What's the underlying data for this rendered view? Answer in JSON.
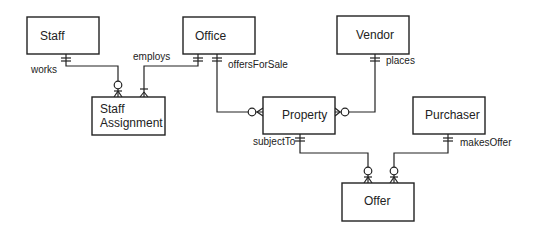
{
  "diagram": {
    "type": "entity-relationship",
    "notation": "crow's foot",
    "entities": [
      {
        "id": "staff",
        "label": [
          "Staff"
        ],
        "x": 27,
        "y": 17,
        "w": 72,
        "h": 37
      },
      {
        "id": "office",
        "label": [
          "Office"
        ],
        "x": 183,
        "y": 17,
        "w": 72,
        "h": 37
      },
      {
        "id": "vendor",
        "label": [
          "Vendor"
        ],
        "x": 337,
        "y": 16,
        "w": 72,
        "h": 38
      },
      {
        "id": "staff_assignment",
        "label": [
          "Staff",
          "Assignment"
        ],
        "x": 92,
        "y": 97,
        "w": 73,
        "h": 38
      },
      {
        "id": "property",
        "label": [
          "Property"
        ],
        "x": 263,
        "y": 97,
        "w": 72,
        "h": 37
      },
      {
        "id": "purchaser",
        "label": [
          "Purchaser"
        ],
        "x": 413,
        "y": 97,
        "w": 72,
        "h": 37
      },
      {
        "id": "offer",
        "label": [
          "Offer"
        ],
        "x": 342,
        "y": 183,
        "w": 72,
        "h": 38
      }
    ],
    "relationships": [
      {
        "id": "works",
        "label": "works",
        "from": "staff",
        "to": "staff_assignment",
        "from_card": "exactly-one",
        "to_card": "zero-or-many"
      },
      {
        "id": "employs",
        "label": "employs",
        "from": "office",
        "to": "staff_assignment",
        "from_card": "exactly-one",
        "to_card": "one-or-many"
      },
      {
        "id": "offersForSale",
        "label": "offersForSale",
        "from": "office",
        "to": "property",
        "from_card": "exactly-one",
        "to_card": "zero-or-many"
      },
      {
        "id": "places",
        "label": "places",
        "from": "vendor",
        "to": "property",
        "from_card": "exactly-one",
        "to_card": "zero-or-many"
      },
      {
        "id": "subjectTo",
        "label": "subjectTo",
        "from": "property",
        "to": "offer",
        "from_card": "exactly-one",
        "to_card": "zero-or-many"
      },
      {
        "id": "makesOffer",
        "label": "makesOffer",
        "from": "purchaser",
        "to": "offer",
        "from_card": "exactly-one",
        "to_card": "zero-or-many"
      }
    ]
  }
}
